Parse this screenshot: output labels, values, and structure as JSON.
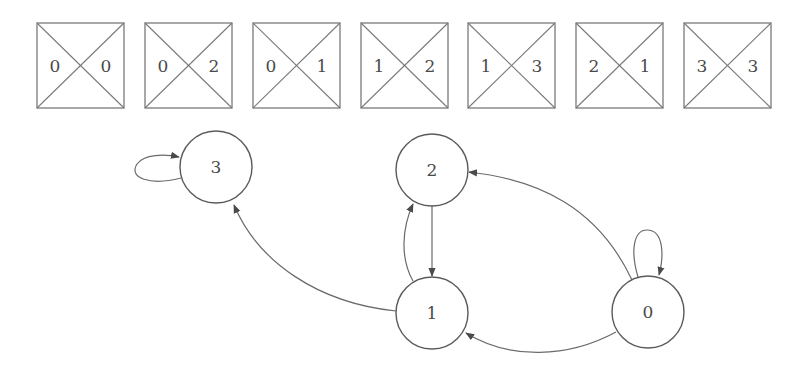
{
  "diagram": {
    "boxes": [
      {
        "left": "0",
        "right": "0"
      },
      {
        "left": "0",
        "right": "2"
      },
      {
        "left": "0",
        "right": "1"
      },
      {
        "left": "1",
        "right": "2"
      },
      {
        "left": "1",
        "right": "3"
      },
      {
        "left": "2",
        "right": "1"
      },
      {
        "left": "3",
        "right": "3"
      }
    ],
    "nodes": [
      {
        "id": "3",
        "label": "3"
      },
      {
        "id": "2",
        "label": "2"
      },
      {
        "id": "1",
        "label": "1"
      },
      {
        "id": "0",
        "label": "0"
      }
    ],
    "edges": [
      {
        "from": "3",
        "to": "3",
        "type": "self-loop"
      },
      {
        "from": "0",
        "to": "0",
        "type": "self-loop"
      },
      {
        "from": "2",
        "to": "1"
      },
      {
        "from": "1",
        "to": "2"
      },
      {
        "from": "1",
        "to": "3"
      },
      {
        "from": "0",
        "to": "2"
      },
      {
        "from": "0",
        "to": "1"
      }
    ],
    "colors": {
      "line": "#6a6a6a",
      "text": "#4a4a4a",
      "background": "#ffffff"
    }
  }
}
